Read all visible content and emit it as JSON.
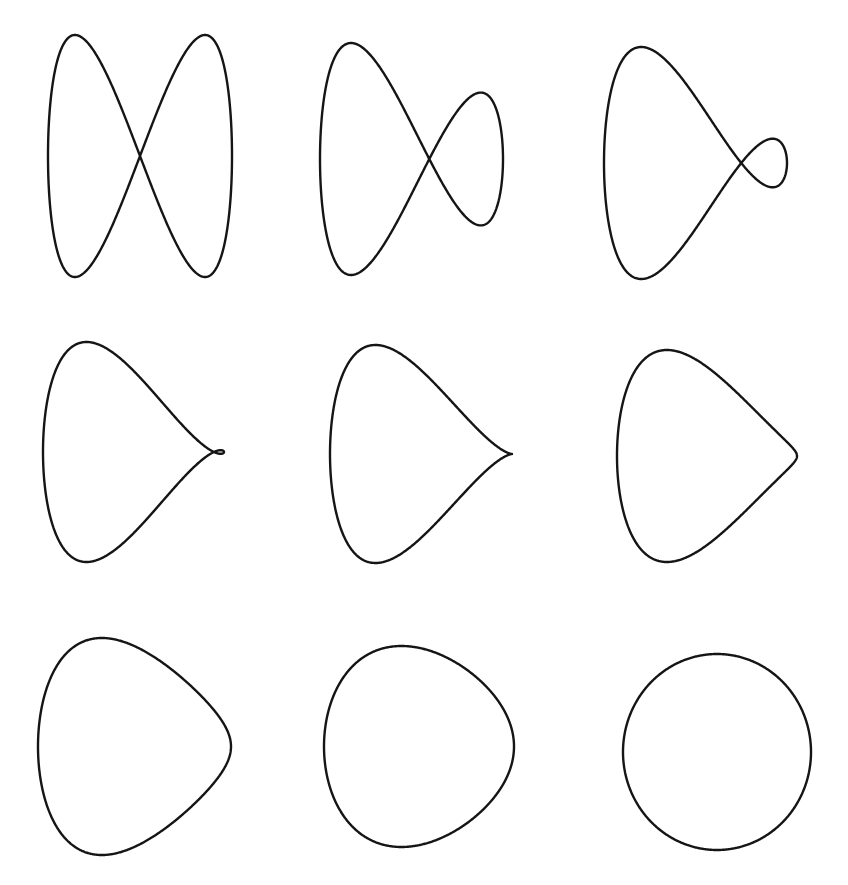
{
  "figure": {
    "stroke_color": "#151515",
    "background": "#ffffff",
    "formula": "x = -cos t, y = (1-a) sin t + a sin 2t",
    "panels": [
      {
        "id": "panel-1",
        "shape": "figure-eight",
        "a": 1.0,
        "box": [
          48,
          232,
          35,
          277
        ]
      },
      {
        "id": "panel-2",
        "shape": "large-side-loop",
        "a": 0.72,
        "box": [
          320,
          503,
          43,
          275
        ]
      },
      {
        "id": "panel-3",
        "shape": "small-side-loop",
        "a": 0.5,
        "box": [
          604,
          787,
          47,
          279
        ]
      },
      {
        "id": "panel-4",
        "shape": "tiny-side-loop",
        "a": 0.36,
        "box": [
          43,
          224,
          342,
          562
        ]
      },
      {
        "id": "panel-5",
        "shape": "cusp",
        "a": 0.3333,
        "box": [
          330,
          512,
          345,
          563
        ]
      },
      {
        "id": "panel-6",
        "shape": "sharp-corner",
        "a": 0.27,
        "box": [
          617,
          797,
          350,
          562
        ]
      },
      {
        "id": "panel-7",
        "shape": "rounded-teardrop",
        "a": 0.18,
        "box": [
          38,
          231,
          638,
          855
        ]
      },
      {
        "id": "panel-8",
        "shape": "rounded-triangle",
        "a": 0.09,
        "box": [
          324,
          514,
          646,
          847
        ]
      },
      {
        "id": "panel-9",
        "shape": "circle",
        "a": 0.0,
        "box": [
          623,
          811,
          654,
          850
        ]
      }
    ]
  }
}
